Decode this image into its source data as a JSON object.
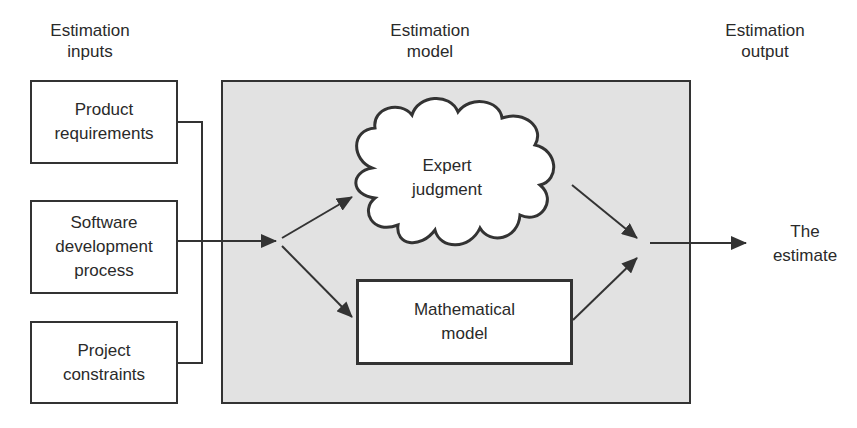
{
  "headers": {
    "inputs": "Estimation\ninputs",
    "model": "Estimation\nmodel",
    "output": "Estimation\noutput"
  },
  "inputs": [
    {
      "label": "Product\nrequirements"
    },
    {
      "label": "Software\ndevelopment\nprocess"
    },
    {
      "label": "Project\nconstraints"
    }
  ],
  "model": {
    "expert": "Expert\njudgment",
    "mathematical": "Mathematical\nmodel"
  },
  "output": {
    "label": "The\nestimate"
  },
  "colors": {
    "stroke": "#333333",
    "model_fill": "#e2e2e2",
    "box_fill": "#ffffff"
  }
}
